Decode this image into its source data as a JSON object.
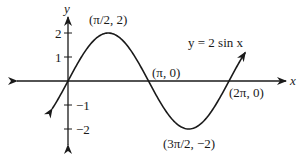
{
  "chart_data": {
    "type": "line",
    "title": "",
    "function_label": "y = 2 sin x",
    "xlabel": "x",
    "ylabel": "y",
    "y_ticks": [
      {
        "value": 2,
        "label": "2"
      },
      {
        "value": 1,
        "label": "1"
      },
      {
        "value": -1,
        "label": "−1"
      },
      {
        "value": -2,
        "label": "−2"
      }
    ],
    "annotations": [
      {
        "x": "π/2",
        "y": 2,
        "label": "(π/2, 2)"
      },
      {
        "x": "π",
        "y": 0,
        "label": "(π, 0)"
      },
      {
        "x": "3π/2",
        "y": -2,
        "label": "(3π/2, −2)"
      },
      {
        "x": "2π",
        "y": 0,
        "label": "(2π, 0)"
      }
    ],
    "series": [
      {
        "name": "y = 2 sin x",
        "x": [
          -0.6,
          0,
          0.785,
          1.571,
          2.356,
          3.142,
          3.927,
          4.712,
          5.498,
          6.283,
          6.9
        ],
        "y": [
          -1.13,
          0,
          1.414,
          2,
          1.414,
          0,
          -1.414,
          -2,
          -1.414,
          0,
          1.16
        ]
      }
    ],
    "xlim": [
      -0.63,
      6.95
    ],
    "ylim": [
      -2.6,
      2.6
    ],
    "grid": false,
    "legend": "none",
    "color": "#1a1a1a"
  }
}
